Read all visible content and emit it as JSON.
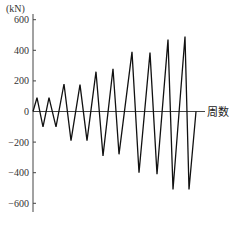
{
  "chart_data": {
    "type": "line",
    "title": "",
    "xlabel": "周数",
    "ylabel": "(kN)",
    "ylim": [
      -650,
      650
    ],
    "yticks": [
      600,
      400,
      200,
      0,
      -200,
      -400,
      -600
    ],
    "ytick_labels": [
      "600",
      "400",
      "200",
      "0",
      "-200",
      "-400",
      "-600"
    ],
    "grid": false,
    "legend": null,
    "series": [
      {
        "name": "load cycles",
        "x": [
          0,
          1,
          2,
          3,
          4,
          5,
          6,
          7,
          8,
          9,
          10,
          11,
          12,
          13,
          14,
          15,
          16,
          17,
          18,
          19,
          20,
          21
        ],
        "values": [
          0,
          90,
          -100,
          90,
          -100,
          180,
          -190,
          175,
          -190,
          260,
          -290,
          280,
          -280,
          390,
          -400,
          385,
          -410,
          470,
          -510,
          490,
          -510,
          0
        ]
      }
    ]
  },
  "axis": {
    "unit_label": "(kN)",
    "x_label": "周数",
    "tick_labels": [
      "600",
      "400",
      "200",
      "0",
      "-200",
      "-400",
      "-600"
    ]
  }
}
